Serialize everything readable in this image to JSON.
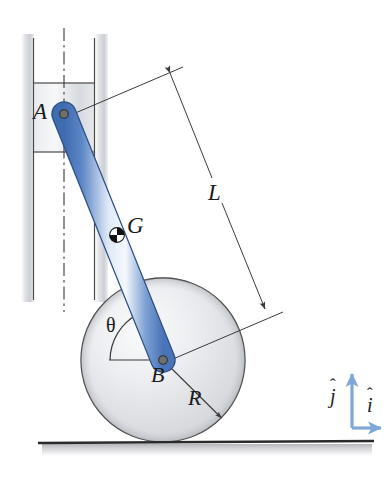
{
  "figure": {
    "background_color": "#ffffff"
  },
  "labels": {
    "point_a": "A",
    "point_b": "B",
    "center_of_mass": "G",
    "rod_length": "L",
    "disk_radius": "R",
    "angle": "θ",
    "unit_vector_i": "i",
    "unit_vector_j": "j",
    "hat_i": "ˆ",
    "hat_j": "ˆ"
  },
  "colors": {
    "rod_blue_dark": "#4a74b8",
    "rod_blue_mid": "#6e97d2",
    "rod_blue_light": "#eaf1fa",
    "rod_outline": "#2d4f86",
    "axis_blue": "#7fa8d8",
    "disk_fill_light": "#f2f3f5",
    "disk_fill_mid": "#d8dade",
    "disk_outline": "#3a3a3a",
    "guide_gray": "#c9cbcf",
    "line_dark": "#3a3a3a",
    "ground_dark": "#2a2a2a",
    "joint_fill": "#6b6b6b",
    "text": "#1a1a1a"
  },
  "geometry": {
    "point_a": {
      "x": 64,
      "y": 114
    },
    "point_b": {
      "x": 163,
      "y": 360
    },
    "point_g": {
      "x": 117,
      "y": 235
    },
    "disk_center": {
      "x": 163,
      "y": 360
    },
    "disk_radius_px": 82,
    "ground_y": 442,
    "rod_half_width": 11,
    "guide_left_x": 33,
    "guide_right_x": 95,
    "slider_top_y": 83,
    "slider_bottom_y": 152
  },
  "elements": {
    "vertical_guide": "vertical-guide-rails",
    "slider_block": "slider-block",
    "centerline": "guide-centerline",
    "rod": "rod-ab",
    "disk": "rolling-disk",
    "ground": "ground-surface",
    "dimension_l": "dimension-line-L",
    "radius_r": "radius-line-R",
    "angle_arc": "angle-arc-theta",
    "axes": "unit-vector-axes"
  }
}
